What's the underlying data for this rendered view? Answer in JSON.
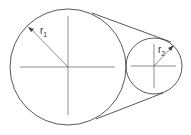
{
  "diagram": {
    "type": "belt-pulley",
    "labels": {
      "r1": {
        "base": "r",
        "sub": "1"
      },
      "r2": {
        "base": "r",
        "sub": "2"
      }
    },
    "colors": {
      "stroke": "#444444",
      "background": "#ffffff"
    }
  }
}
